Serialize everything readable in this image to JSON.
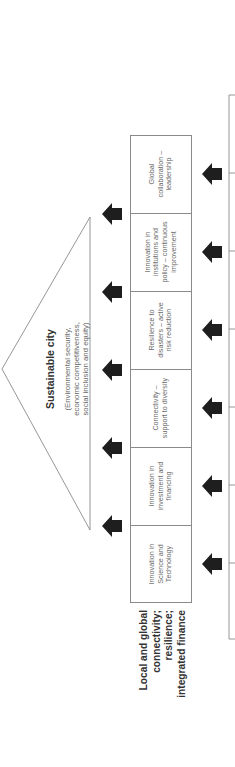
{
  "figure": {
    "orientation": "rotated 90 degrees counter-clockwise",
    "colors": {
      "arrow": "#1e1e1e",
      "line": "#8a8a8a",
      "title_text": "#333333",
      "cell_text": "#6a6a6a"
    },
    "goal": {
      "title": "Sustainable city",
      "subtitle_lines": [
        "(Environmental security,",
        "economic competitiveness,",
        "social inclusion and equity)"
      ]
    },
    "pillars": [
      {
        "lines": [
          "Innovation in",
          "Science and",
          "Technology"
        ]
      },
      {
        "lines": [
          "Innovation in",
          "investment and",
          "financing"
        ]
      },
      {
        "lines": [
          "Connectivity –",
          "support to diversity"
        ]
      },
      {
        "lines": [
          "Resilience to",
          "disasters – active",
          "risk reduction"
        ]
      },
      {
        "lines": [
          "Innovation in",
          "institutions and",
          "policy – continuous",
          "improvement"
        ]
      },
      {
        "lines": [
          "Global",
          "collaboration –",
          "leadership"
        ]
      }
    ],
    "foundation_label": {
      "lines": [
        "Local and global",
        "connectivity;",
        "resilience;",
        "integrated finance"
      ]
    },
    "arrows": {
      "upper_row_count": 5,
      "lower_row_count": 6,
      "icon": "block-arrow-up-icon"
    }
  }
}
